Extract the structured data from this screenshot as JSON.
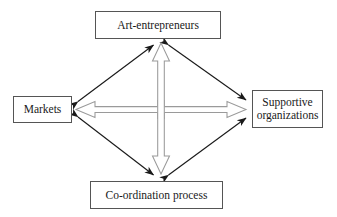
{
  "diagram": {
    "background_color": "#ffffff",
    "box_border_color": "#555555",
    "solid_arrow_color": "#1a1a1a",
    "hollow_arrow_stroke_color": "#8a8a8a",
    "hollow_arrow_fill_color": "#ffffff",
    "nodes": [
      {
        "id": "art-entrepreneurs",
        "label": "Art-entrepreneurs",
        "position": "top"
      },
      {
        "id": "markets",
        "label": "Markets",
        "position": "left"
      },
      {
        "id": "supportive-organizations",
        "label": "Supportive\norganizations",
        "position": "right"
      },
      {
        "id": "coordination-process",
        "label": "Co-ordination process",
        "position": "bottom"
      }
    ],
    "connectors": [
      {
        "id": "markets-to-art-entrepreneurs",
        "style": "solid-double-headed",
        "from": "markets",
        "to": "art-entrepreneurs"
      },
      {
        "id": "art-entrepreneurs-to-supportive-organizations",
        "style": "solid-double-headed",
        "from": "art-entrepreneurs",
        "to": "supportive-organizations"
      },
      {
        "id": "markets-to-coordination-process",
        "style": "solid-double-headed",
        "from": "markets",
        "to": "coordination-process"
      },
      {
        "id": "coordination-process-to-supportive-organizations",
        "style": "solid-double-headed",
        "from": "coordination-process",
        "to": "supportive-organizations"
      },
      {
        "id": "vertical-hollow-arrow",
        "style": "hollow-double-headed",
        "from": "coordination-process",
        "to": "art-entrepreneurs"
      },
      {
        "id": "horizontal-hollow-arrow",
        "style": "hollow-double-headed",
        "from": "markets",
        "to": "supportive-organizations"
      }
    ]
  }
}
